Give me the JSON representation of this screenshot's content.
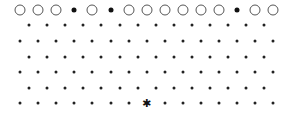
{
  "board": {
    "rows": [
      {
        "y": 10,
        "x0": 20,
        "count": 15,
        "cells": [
          "ring",
          "ring",
          "ring",
          "filled",
          "ring",
          "filled",
          "ring",
          "ring",
          "ring",
          "ring",
          "ring",
          "ring",
          "filled",
          "ring",
          "ring"
        ]
      },
      {
        "y": 25,
        "x0": 29,
        "count": 14,
        "cells": [
          "dot",
          "dot",
          "dot",
          "dot",
          "dot",
          "dot",
          "dot",
          "dot",
          "dot",
          "dot",
          "dot",
          "dot",
          "dot",
          "dot"
        ]
      },
      {
        "y": 41,
        "x0": 20,
        "count": 15,
        "cells": [
          "dot",
          "dot",
          "dot",
          "dot",
          "dot",
          "dot",
          "dot",
          "dot",
          "dot",
          "dot",
          "dot",
          "dot",
          "dot",
          "dot",
          "dot"
        ]
      },
      {
        "y": 57,
        "x0": 29,
        "count": 14,
        "cells": [
          "dot",
          "dot",
          "dot",
          "dot",
          "dot",
          "dot",
          "dot",
          "dot",
          "dot",
          "dot",
          "dot",
          "dot",
          "dot",
          "dot"
        ]
      },
      {
        "y": 72,
        "x0": 20,
        "count": 15,
        "cells": [
          "dot",
          "dot",
          "dot",
          "dot",
          "dot",
          "dot",
          "dot",
          "dot",
          "dot",
          "dot",
          "dot",
          "dot",
          "dot",
          "dot",
          "dot"
        ]
      },
      {
        "y": 88,
        "x0": 29,
        "count": 14,
        "cells": [
          "dot",
          "dot",
          "dot",
          "dot",
          "dot",
          "dot",
          "dot",
          "dot",
          "dot",
          "dot",
          "dot",
          "dot",
          "dot",
          "dot"
        ]
      },
      {
        "y": 103,
        "x0": 20,
        "count": 15,
        "cells": [
          "dot",
          "dot",
          "dot",
          "dot",
          "dot",
          "dot",
          "dot",
          "star",
          "dot",
          "dot",
          "dot",
          "dot",
          "dot",
          "dot",
          "dot"
        ]
      }
    ],
    "spacing": 18.1,
    "star_glyph": "✱",
    "colors": {
      "ring": "#555555",
      "fill": "#111111",
      "background": "#ffffff"
    }
  }
}
